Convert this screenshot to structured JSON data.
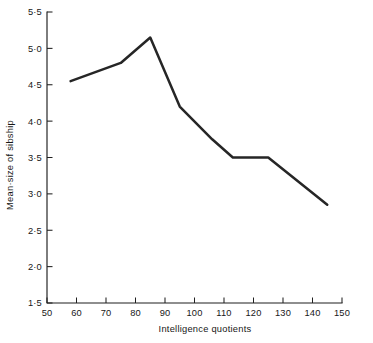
{
  "chart_data": {
    "type": "line",
    "title": "",
    "xlabel": "Intelligence quotients",
    "ylabel": "Mean·size of sibship",
    "xlim": [
      50,
      150
    ],
    "ylim": [
      1.5,
      5.5
    ],
    "grid": false,
    "legend": "none",
    "x_ticks": [
      50,
      60,
      70,
      80,
      90,
      100,
      110,
      120,
      130,
      140,
      150
    ],
    "x_tick_labels": [
      "50",
      "60",
      "70",
      "80",
      "90",
      "100",
      "110",
      "120",
      "130",
      "140",
      "150"
    ],
    "y_ticks": [
      1.5,
      2.0,
      2.5,
      3.0,
      3.5,
      4.0,
      4.5,
      5.0,
      5.5
    ],
    "y_tick_labels": [
      "1·5",
      "2·0",
      "2·5",
      "3·0",
      "3·5",
      "4·0",
      "4·5",
      "5·0",
      "5·5"
    ],
    "series": [
      {
        "name": "Mean size of sibship",
        "color": "#262626",
        "x": [
          58,
          75,
          85,
          95,
          106,
          113,
          125,
          145
        ],
        "values": [
          4.55,
          4.8,
          5.15,
          4.2,
          3.75,
          3.5,
          3.5,
          2.85
        ]
      }
    ]
  }
}
